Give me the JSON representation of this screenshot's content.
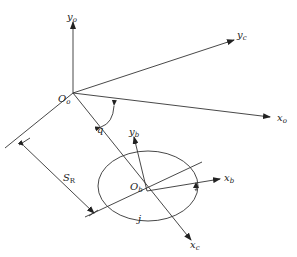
{
  "diagram": {
    "labels": {
      "y_o": {
        "main": "y",
        "sub": "o"
      },
      "y_c": {
        "main": "y",
        "sub": "c"
      },
      "x_o": {
        "main": "x",
        "sub": "o"
      },
      "O_o": {
        "main": "O",
        "sub": "o"
      },
      "q": {
        "main": "q"
      },
      "y_b": {
        "main": "y",
        "sub": "b"
      },
      "x_b": {
        "main": "x",
        "sub": "b"
      },
      "O_b": {
        "main": "O",
        "sub": "b"
      },
      "S_R": {
        "main": "S",
        "sub": "R"
      },
      "j": {
        "main": "j"
      },
      "x_c": {
        "main": "x",
        "sub": "c"
      }
    },
    "colors": {
      "line": "#333333",
      "background": "#ffffff"
    }
  }
}
